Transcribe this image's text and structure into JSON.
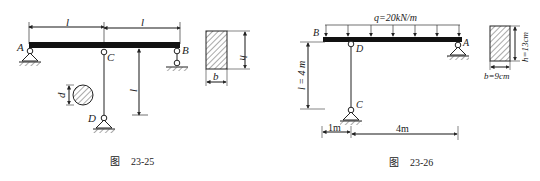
{
  "figures": [
    {
      "caption_prefix": "图",
      "caption_number": "23-25",
      "labels": {
        "A": "A",
        "B": "B",
        "C": "C",
        "D": "D"
      },
      "dimensions": {
        "span_left": "l",
        "span_right": "l",
        "column_length": "l",
        "diameter": "d",
        "section_h": "h",
        "section_b": "b"
      }
    },
    {
      "caption_prefix": "图",
      "caption_number": "23-26",
      "load": "q=20kN/m",
      "labels": {
        "A": "A",
        "B": "B",
        "C": "C",
        "D": "D"
      },
      "dimensions": {
        "column_length": "l = 4 m",
        "left_offset": "1m",
        "right_span": "4m",
        "section_h": "h=13cm",
        "section_b": "b=9cm"
      }
    }
  ]
}
